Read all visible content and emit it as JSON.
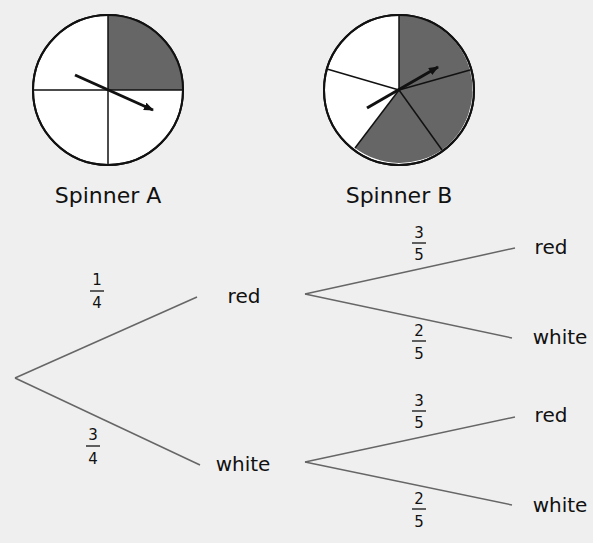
{
  "spinners": {
    "a": {
      "label": "Spinner A",
      "sectors_total": 4,
      "sectors_shaded": 1,
      "shaded_color": "#666666",
      "unshaded_color": "#ffffff"
    },
    "b": {
      "label": "Spinner B",
      "sectors_total": 5,
      "sectors_shaded": 3,
      "shaded_color": "#666666",
      "unshaded_color": "#ffffff"
    }
  },
  "tree": {
    "first": {
      "top": {
        "node": "red",
        "prob_num": "1",
        "prob_den": "4"
      },
      "bottom": {
        "node": "white",
        "prob_num": "3",
        "prob_den": "4"
      }
    },
    "second_from_red": {
      "top": {
        "node": "red",
        "prob_num": "3",
        "prob_den": "5"
      },
      "bottom": {
        "node": "white",
        "prob_num": "2",
        "prob_den": "5"
      }
    },
    "second_from_white": {
      "top": {
        "node": "red",
        "prob_num": "3",
        "prob_den": "5"
      },
      "bottom": {
        "node": "white",
        "prob_num": "2",
        "prob_den": "5"
      }
    }
  },
  "colors": {
    "background": "#efefef",
    "branch_line": "#666666",
    "shaded": "#666666"
  }
}
